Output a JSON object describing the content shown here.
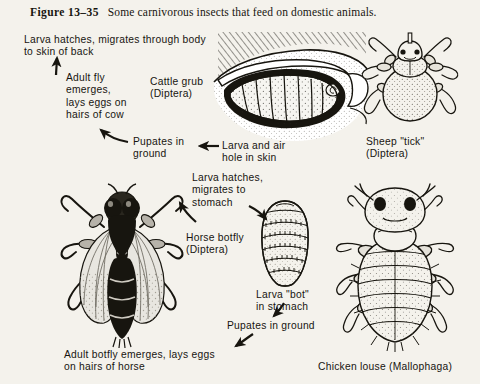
{
  "figure": {
    "number": "Figure 13–35",
    "caption": "Some carnivorous insects that feed on domestic animals."
  },
  "annotations": {
    "larva_hatches_back": "Larva hatches, migrates through body\nto skin of back",
    "adult_fly_emerges": "Adult fly\nemerges,\nlays eggs on\nhairs of cow",
    "cattle_grub": "Cattle grub\n(Diptera)",
    "pupates_in_ground_cow": "Pupates in\nground",
    "larva_air_hole": "Larva and air\nhole in skin",
    "sheep_tick": "Sheep \"tick\"\n(Diptera)",
    "larva_hatches_stomach": "Larva hatches,\nmigrates to\nstomach",
    "horse_botfly": "Horse botfly\n(Diptera)",
    "larva_bot_stomach": "Larva \"bot\"\nin stomach",
    "pupates_in_ground_horse": "Pupates in ground",
    "adult_botfly_emerges": "Adult botfly emerges, lays eggs\non hairs of horse",
    "chicken_louse": "Chicken louse (Mallophaga)"
  },
  "illustrations": {
    "cattle_grub_in_skin": "cattle-grub-larva-in-skin-cross-section",
    "sheep_tick": "sheep-ked-tick-dorsal-view",
    "horse_botfly": "horse-botfly-adult-dorsal-view",
    "bot_larva": "bot-larva-segmented-ovoid",
    "chicken_louse": "chicken-louse-dorsal-view"
  },
  "colors": {
    "paper": "#f4f2ec",
    "ink": "#171510",
    "wing": "#dcd9d1"
  }
}
